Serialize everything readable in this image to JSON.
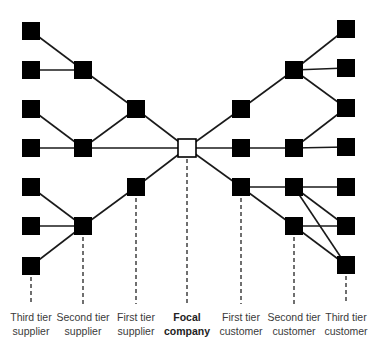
{
  "diagram": {
    "type": "supply-chain-network",
    "node_size": 18,
    "colors": {
      "node_fill": "#000000",
      "focal_fill": "#ffffff",
      "edge": "#1a1a1a"
    },
    "tiers": [
      {
        "id": "t3s",
        "label_line1": "Third tier",
        "label_line2": "supplier",
        "x": 31,
        "bold": false
      },
      {
        "id": "t2s",
        "label_line1": "Second tier",
        "label_line2": "supplier",
        "x": 83,
        "bold": false
      },
      {
        "id": "t1s",
        "label_line1": "First tier",
        "label_line2": "supplier",
        "x": 136,
        "bold": false
      },
      {
        "id": "focal",
        "label_line1": "Focal",
        "label_line2": "company",
        "x": 187,
        "bold": true
      },
      {
        "id": "t1c",
        "label_line1": "First tier",
        "label_line2": "customer",
        "x": 241,
        "bold": false
      },
      {
        "id": "t2c",
        "label_line1": "Second tier",
        "label_line2": "customer",
        "x": 294,
        "bold": false
      },
      {
        "id": "t3c",
        "label_line1": "Third tier",
        "label_line2": "customer",
        "x": 346,
        "bold": false
      }
    ],
    "nodes": [
      {
        "id": "s3a",
        "tier": "t3s",
        "x": 31,
        "y": 31
      },
      {
        "id": "s3b",
        "tier": "t3s",
        "x": 31,
        "y": 70
      },
      {
        "id": "s3c",
        "tier": "t3s",
        "x": 31,
        "y": 109
      },
      {
        "id": "s3d",
        "tier": "t3s",
        "x": 31,
        "y": 148
      },
      {
        "id": "s3e",
        "tier": "t3s",
        "x": 31,
        "y": 187
      },
      {
        "id": "s3f",
        "tier": "t3s",
        "x": 31,
        "y": 226
      },
      {
        "id": "s3g",
        "tier": "t3s",
        "x": 31,
        "y": 266
      },
      {
        "id": "s2a",
        "tier": "t2s",
        "x": 83,
        "y": 70
      },
      {
        "id": "s2b",
        "tier": "t2s",
        "x": 83,
        "y": 148
      },
      {
        "id": "s2c",
        "tier": "t2s",
        "x": 83,
        "y": 226
      },
      {
        "id": "s1a",
        "tier": "t1s",
        "x": 136,
        "y": 109
      },
      {
        "id": "s1b",
        "tier": "t1s",
        "x": 136,
        "y": 187
      },
      {
        "id": "f",
        "tier": "focal",
        "x": 187,
        "y": 148,
        "focal": true
      },
      {
        "id": "c1a",
        "tier": "t1c",
        "x": 241,
        "y": 109
      },
      {
        "id": "c1b",
        "tier": "t1c",
        "x": 241,
        "y": 148
      },
      {
        "id": "c1c",
        "tier": "t1c",
        "x": 241,
        "y": 187
      },
      {
        "id": "c2a",
        "tier": "t2c",
        "x": 294,
        "y": 70
      },
      {
        "id": "c2b",
        "tier": "t2c",
        "x": 294,
        "y": 148
      },
      {
        "id": "c2c",
        "tier": "t2c",
        "x": 294,
        "y": 187
      },
      {
        "id": "c2d",
        "tier": "t2c",
        "x": 294,
        "y": 226
      },
      {
        "id": "c3a",
        "tier": "t3c",
        "x": 346,
        "y": 29
      },
      {
        "id": "c3b",
        "tier": "t3c",
        "x": 346,
        "y": 68
      },
      {
        "id": "c3c",
        "tier": "t3c",
        "x": 346,
        "y": 108
      },
      {
        "id": "c3d",
        "tier": "t3c",
        "x": 346,
        "y": 147
      },
      {
        "id": "c3e",
        "tier": "t3c",
        "x": 346,
        "y": 187
      },
      {
        "id": "c3f",
        "tier": "t3c",
        "x": 346,
        "y": 226
      },
      {
        "id": "c3g",
        "tier": "t3c",
        "x": 346,
        "y": 265
      }
    ],
    "edges": [
      [
        "s3a",
        "s2a"
      ],
      [
        "s3b",
        "s2a"
      ],
      [
        "s2a",
        "s1a"
      ],
      [
        "s1a",
        "f"
      ],
      [
        "s3c",
        "s2b"
      ],
      [
        "s3d",
        "s2b"
      ],
      [
        "s2b",
        "s1a"
      ],
      [
        "s2b",
        "f"
      ],
      [
        "s3e",
        "s2c"
      ],
      [
        "s3f",
        "s2c"
      ],
      [
        "s3g",
        "s2c"
      ],
      [
        "s2c",
        "s1b"
      ],
      [
        "s1b",
        "f"
      ],
      [
        "f",
        "c1a"
      ],
      [
        "f",
        "c1b"
      ],
      [
        "f",
        "c1c"
      ],
      [
        "c1a",
        "c2a"
      ],
      [
        "c2a",
        "c3a"
      ],
      [
        "c2a",
        "c3b"
      ],
      [
        "c2a",
        "c3c"
      ],
      [
        "c1b",
        "c2b"
      ],
      [
        "c2b",
        "c3c"
      ],
      [
        "c2b",
        "c3d"
      ],
      [
        "c1c",
        "c2c"
      ],
      [
        "c1c",
        "c2d"
      ],
      [
        "c2c",
        "c3e"
      ],
      [
        "c2c",
        "c3f"
      ],
      [
        "c2c",
        "c3g"
      ],
      [
        "c2d",
        "c3f"
      ],
      [
        "c2d",
        "c3g"
      ]
    ],
    "dashed_drop_lines": [
      {
        "x": 31,
        "from_node": "s3g"
      },
      {
        "x": 83,
        "from_node": "s2c"
      },
      {
        "x": 136,
        "from_node": "s1b"
      },
      {
        "x": 187,
        "from_node": "f"
      },
      {
        "x": 241,
        "from_node": "c1c"
      },
      {
        "x": 294,
        "from_node": "c2d"
      },
      {
        "x": 346,
        "from_node": "c3g"
      }
    ],
    "drop_line_end_y": 304
  }
}
